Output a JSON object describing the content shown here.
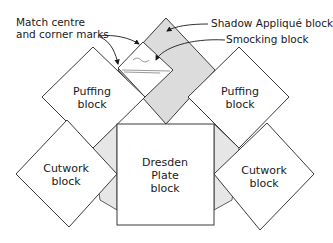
{
  "diagram": {
    "type": "quilt block layout",
    "colors": {
      "block_fill": "#ffffff",
      "shaded_fill": "#dcdcdc",
      "triangle_fill": "#e6e6e6",
      "outline": "#3a3a3a"
    },
    "callouts": {
      "match_marks_line1": "Match centre",
      "match_marks_line2": "and corner marks",
      "shadow_applique": "Shadow Appliqué block",
      "smocking": "Smocking block"
    },
    "blocks": {
      "puffing_left": {
        "line1": "Puffing",
        "line2": "block"
      },
      "puffing_right": {
        "line1": "Puffing",
        "line2": "block"
      },
      "cutwork_left": {
        "line1": "Cutwork",
        "line2": "block"
      },
      "cutwork_right": {
        "line1": "Cutwork",
        "line2": "block"
      },
      "dresden": {
        "line1": "Dresden",
        "line2": "Plate",
        "line3": "block"
      }
    }
  }
}
